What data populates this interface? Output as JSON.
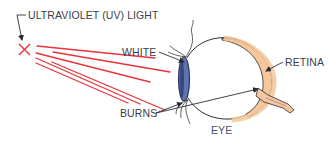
{
  "diagram": {
    "labels": {
      "uv_light": "ULTRAVIOLET (UV) LIGHT",
      "white": "WHITE",
      "retina": "RETINA",
      "burns": "BURNS",
      "eye": "EYE"
    },
    "colors": {
      "rays": "#e8343a",
      "source_x": "#e8343a",
      "cornea": "#5f73b0",
      "cornea_dark": "#2a3560",
      "retina_fill": "#f5c79a",
      "outline": "#2b2b35",
      "label_text": "#3a3d4a",
      "eyelid_hair": "#4a5a2a"
    },
    "ray_count": 6
  }
}
